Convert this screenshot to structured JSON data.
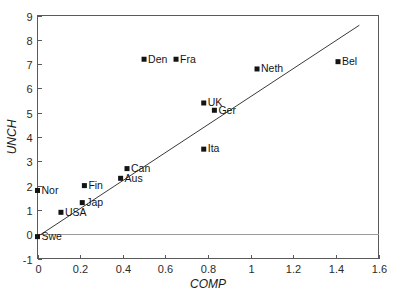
{
  "chart_data": {
    "type": "scatter",
    "title": "",
    "xlabel": "COMP",
    "ylabel": "UNCH",
    "xlim": [
      0,
      1.6
    ],
    "ylim": [
      -1,
      9
    ],
    "xticks": [
      "0",
      "0.2",
      "0.4",
      "0.6",
      "0.8",
      "1",
      "1.2",
      "1.4",
      "1.6"
    ],
    "xtick_values": [
      0,
      0.2,
      0.4,
      0.6,
      0.8,
      1.0,
      1.2,
      1.4,
      1.6
    ],
    "yticks": [
      "-1",
      "0",
      "1",
      "2",
      "3",
      "4",
      "5",
      "6",
      "7",
      "8",
      "9"
    ],
    "ytick_values": [
      -1,
      0,
      1,
      2,
      3,
      4,
      5,
      6,
      7,
      8,
      9
    ],
    "grid": "zero-line-only",
    "legend": "none",
    "points": [
      {
        "label": "Swe",
        "x": 0.0,
        "y": -0.1
      },
      {
        "label": "Nor",
        "x": 0.0,
        "y": 1.8
      },
      {
        "label": "USA",
        "x": 0.11,
        "y": 0.9
      },
      {
        "label": "Jap",
        "x": 0.21,
        "y": 1.3
      },
      {
        "label": "Fin",
        "x": 0.22,
        "y": 2.0
      },
      {
        "label": "Aus",
        "x": 0.39,
        "y": 2.3
      },
      {
        "label": "Can",
        "x": 0.42,
        "y": 2.7
      },
      {
        "label": "Den",
        "x": 0.5,
        "y": 7.2
      },
      {
        "label": "Fra",
        "x": 0.65,
        "y": 7.2
      },
      {
        "label": "Ita",
        "x": 0.78,
        "y": 3.5
      },
      {
        "label": "UK",
        "x": 0.78,
        "y": 5.4
      },
      {
        "label": "Ger",
        "x": 0.83,
        "y": 5.1
      },
      {
        "label": "Neth",
        "x": 1.03,
        "y": 6.8
      },
      {
        "label": "Bel",
        "x": 1.41,
        "y": 7.1
      }
    ],
    "trend_line": {
      "x_start": 0.0,
      "y_start": -0.1,
      "x_end": 1.51,
      "y_end": 8.6
    },
    "marker_style": "filled-square",
    "marker_color": "#141414",
    "line_color": "#3a3a3a",
    "axis_color": "#5a5a5a"
  }
}
